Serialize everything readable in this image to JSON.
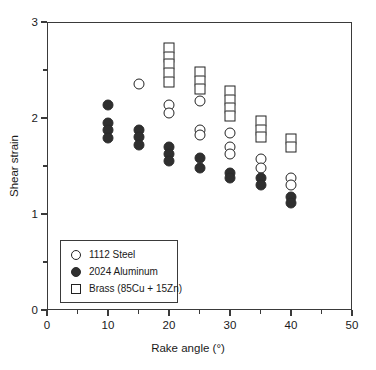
{
  "chart_data": {
    "type": "scatter",
    "title": "",
    "xlabel": "Rake angle (°)",
    "ylabel": "Shear strain",
    "xlim": [
      0,
      50
    ],
    "ylim": [
      0,
      3
    ],
    "xticks": [
      0,
      10,
      20,
      30,
      40,
      50
    ],
    "xtick_labels": [
      "0",
      "10",
      "20",
      "30",
      "40",
      "50"
    ],
    "xminor_ticks": [
      5,
      15,
      25,
      35,
      45
    ],
    "yticks": [
      0,
      1,
      2,
      3
    ],
    "ytick_labels": [
      "0",
      "1",
      "2",
      "3"
    ],
    "yminor_ticks": [
      0.5,
      1.5,
      2.5
    ],
    "grid": false,
    "legend_position": "lower-left",
    "series": [
      {
        "name": "1112 Steel",
        "marker": "circle-open",
        "color": "#ffffff",
        "edge_color": "#222222",
        "points": [
          {
            "x": 15,
            "y": 2.35
          },
          {
            "x": 20,
            "y": 2.14
          },
          {
            "x": 20,
            "y": 2.05
          },
          {
            "x": 25,
            "y": 2.18
          },
          {
            "x": 25,
            "y": 1.88
          },
          {
            "x": 25,
            "y": 1.82
          },
          {
            "x": 30,
            "y": 1.84
          },
          {
            "x": 30,
            "y": 1.7
          },
          {
            "x": 30,
            "y": 1.62
          },
          {
            "x": 35,
            "y": 1.57
          },
          {
            "x": 35,
            "y": 1.48
          },
          {
            "x": 40,
            "y": 1.38
          },
          {
            "x": 40,
            "y": 1.3
          }
        ]
      },
      {
        "name": "2024 Aluminum",
        "marker": "circle-filled",
        "color": "#2f2f2f",
        "edge_color": "#2b2b2b",
        "points": [
          {
            "x": 10,
            "y": 2.14
          },
          {
            "x": 10,
            "y": 1.95
          },
          {
            "x": 10,
            "y": 1.87
          },
          {
            "x": 10,
            "y": 1.79
          },
          {
            "x": 15,
            "y": 1.88
          },
          {
            "x": 15,
            "y": 1.8
          },
          {
            "x": 15,
            "y": 1.72
          },
          {
            "x": 20,
            "y": 1.7
          },
          {
            "x": 20,
            "y": 1.62
          },
          {
            "x": 20,
            "y": 1.55
          },
          {
            "x": 25,
            "y": 1.58
          },
          {
            "x": 25,
            "y": 1.48
          },
          {
            "x": 30,
            "y": 1.43
          },
          {
            "x": 30,
            "y": 1.38
          },
          {
            "x": 35,
            "y": 1.38
          },
          {
            "x": 35,
            "y": 1.3
          },
          {
            "x": 40,
            "y": 1.18
          },
          {
            "x": 40,
            "y": 1.11
          }
        ]
      },
      {
        "name": "Brass (85Cu + 15Zn)",
        "marker": "square-open",
        "color": "#ffffff",
        "edge_color": "#222222",
        "points": [
          {
            "x": 20,
            "y": 2.73
          },
          {
            "x": 20,
            "y": 2.64
          },
          {
            "x": 20,
            "y": 2.56
          },
          {
            "x": 20,
            "y": 2.47
          },
          {
            "x": 20,
            "y": 2.38
          },
          {
            "x": 25,
            "y": 2.48
          },
          {
            "x": 25,
            "y": 2.39
          },
          {
            "x": 25,
            "y": 2.3
          },
          {
            "x": 30,
            "y": 2.28
          },
          {
            "x": 30,
            "y": 2.19
          },
          {
            "x": 30,
            "y": 2.1
          },
          {
            "x": 30,
            "y": 2.02
          },
          {
            "x": 35,
            "y": 1.97
          },
          {
            "x": 35,
            "y": 1.88
          },
          {
            "x": 35,
            "y": 1.8
          },
          {
            "x": 40,
            "y": 1.78
          },
          {
            "x": 40,
            "y": 1.7
          }
        ]
      }
    ]
  },
  "legend": {
    "items": [
      {
        "label": "1112 Steel",
        "marker": "circle-open"
      },
      {
        "label": "2024 Aluminum",
        "marker": "circle-filled"
      },
      {
        "label": "Brass (85Cu + 15Zn)",
        "marker": "square-open"
      }
    ]
  },
  "axes": {
    "x_title": "Rake angle (°)",
    "y_title": "Shear strain"
  }
}
